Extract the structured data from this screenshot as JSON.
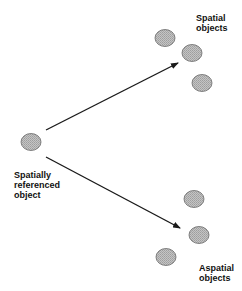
{
  "diagram": {
    "source": {
      "label_lines": [
        "Spatially",
        "referenced",
        "object"
      ]
    },
    "targets": [
      {
        "id": "spatial",
        "label_lines": [
          "Spatial",
          "objects"
        ],
        "object_count": 3
      },
      {
        "id": "aspatial",
        "label_lines": [
          "Aspatial",
          "objects"
        ],
        "object_count": 3
      }
    ],
    "edges": [
      {
        "from": "source",
        "to": "spatial"
      },
      {
        "from": "source",
        "to": "aspatial"
      }
    ],
    "colors": {
      "object_fill": "#b8b8b8",
      "object_stroke": "#6a6a6a",
      "arrow": "#1a1a1a",
      "text": "#111111",
      "background": "#ffffff"
    }
  }
}
